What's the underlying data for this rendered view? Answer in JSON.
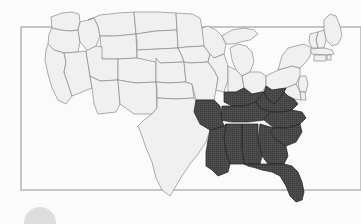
{
  "canvas": {
    "width": 361,
    "height": 224,
    "background_color": "#fbfbfb"
  },
  "frame": {
    "name": "background-rectangle",
    "x": 21,
    "y": 27,
    "width": 340,
    "height": 163,
    "stroke_color": "#b0b0b0",
    "stroke_width": 1.4,
    "fill": "none",
    "note": "thin rectangle drawn behind the map; top edge passes behind Maine, bottom edge passes behind Florida and Texas"
  },
  "map": {
    "title": "",
    "subject": "United States state map with southeastern region highlighted",
    "projection_look": "albers-usa",
    "default_state_fill": "#f0f0f0",
    "default_state_stroke": "#8a8a8a",
    "highlight_fill": "#4a4a4a",
    "highlight_stroke": "#1f1f1f",
    "highlight_texture": "fine crosshatch of vertical and horizontal lines",
    "stroke_width": 0.7,
    "highlighted_states": [
      "Louisiana",
      "Arkansas",
      "Mississippi",
      "Alabama",
      "Tennessee",
      "Kentucky",
      "Georgia",
      "Florida",
      "South Carolina",
      "North Carolina",
      "Virginia",
      "West Virginia"
    ],
    "unhighlighted_states": [
      "Washington",
      "Oregon",
      "California",
      "Nevada",
      "Idaho",
      "Montana",
      "Wyoming",
      "Utah",
      "Arizona",
      "Colorado",
      "New Mexico",
      "North Dakota",
      "South Dakota",
      "Nebraska",
      "Kansas",
      "Oklahoma",
      "Texas",
      "Minnesota",
      "Iowa",
      "Missouri",
      "Wisconsin",
      "Illinois",
      "Michigan",
      "Indiana",
      "Ohio",
      "Pennsylvania",
      "New York",
      "Maine",
      "New Hampshire",
      "Vermont",
      "Massachusetts",
      "Rhode Island",
      "Connecticut",
      "New Jersey",
      "Delaware",
      "Maryland"
    ]
  },
  "artifact": {
    "name": "corner-circle",
    "shape": "circle",
    "center_x": 40,
    "center_y": 223,
    "radius": 16,
    "color": "#d8d8d8",
    "note": "faint light-gray disc clipped by the bottom-left edge of the frame"
  }
}
